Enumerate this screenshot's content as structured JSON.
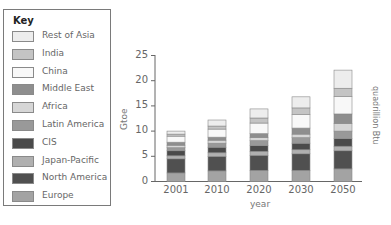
{
  "key": {
    "title": "Key",
    "items": [
      {
        "label": "Rest of Asia",
        "color": "#ededed"
      },
      {
        "label": "India",
        "color": "#c4c4c4"
      },
      {
        "label": "China",
        "color": "#f8f8f8"
      },
      {
        "label": "Middle East",
        "color": "#8e8e8e"
      },
      {
        "label": "Africa",
        "color": "#d6d6d6"
      },
      {
        "label": "Latin America",
        "color": "#999999"
      },
      {
        "label": "CIS",
        "color": "#4a4a4a"
      },
      {
        "label": "Japan-Pacific",
        "color": "#b0b0b0"
      },
      {
        "label": "North America",
        "color": "#505050"
      },
      {
        "label": "Europe",
        "color": "#a3a3a3"
      }
    ]
  },
  "chart_data": {
    "type": "bar",
    "stacked": true,
    "title": "",
    "xlabel": "year",
    "ylabel": "Gtoe",
    "secondary_ylabel": "quadrillion Btu",
    "ylim": [
      0,
      25
    ],
    "yticks": [
      0,
      5,
      10,
      15,
      20,
      25
    ],
    "grid": false,
    "legend_position": "left",
    "categories": [
      "2001",
      "2010",
      "2020",
      "2030",
      "2050"
    ],
    "series": [
      {
        "name": "Europe",
        "values": [
          1.7,
          2.1,
          2.2,
          2.2,
          2.5
        ]
      },
      {
        "name": "North America",
        "values": [
          2.8,
          2.9,
          3.0,
          3.3,
          3.6
        ]
      },
      {
        "name": "Japan-Pacific",
        "values": [
          0.6,
          0.7,
          0.8,
          0.8,
          0.9
        ]
      },
      {
        "name": "CIS",
        "values": [
          1.0,
          1.1,
          1.1,
          1.3,
          1.5
        ]
      },
      {
        "name": "Latin America",
        "values": [
          0.6,
          0.8,
          1.0,
          1.1,
          1.5
        ]
      },
      {
        "name": "Africa",
        "values": [
          0.5,
          0.6,
          0.6,
          0.7,
          1.5
        ]
      },
      {
        "name": "Middle East",
        "values": [
          0.6,
          0.6,
          0.8,
          1.2,
          1.9
        ]
      },
      {
        "name": "China",
        "values": [
          1.2,
          1.6,
          2.1,
          2.7,
          3.5
        ]
      },
      {
        "name": "India",
        "values": [
          0.4,
          0.6,
          1.0,
          1.3,
          1.6
        ]
      },
      {
        "name": "Rest of Asia",
        "values": [
          0.6,
          1.2,
          1.8,
          2.2,
          3.6
        ]
      }
    ],
    "totals": [
      10.0,
      12.2,
      14.4,
      16.8,
      22.1
    ]
  }
}
